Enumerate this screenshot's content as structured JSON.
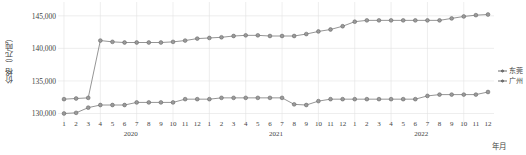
{
  "chart_data": {
    "type": "line",
    "title": "",
    "xlabel": "年月",
    "ylabel": "价格（元/吨）",
    "ylim": [
      129000,
      146200
    ],
    "yticks": [
      130000,
      135000,
      140000,
      145000
    ],
    "ytick_labels": [
      "130,000",
      "135,000",
      "140,000",
      "145,000"
    ],
    "grid": true,
    "legend_position": "right",
    "x": [
      "1",
      "2",
      "3",
      "4",
      "5",
      "6",
      "7",
      "8",
      "9",
      "10",
      "11",
      "12",
      "1",
      "2",
      "3",
      "4",
      "5",
      "6",
      "7",
      "8",
      "9",
      "10",
      "11",
      "12",
      "1",
      "2",
      "3",
      "4",
      "5",
      "6",
      "7",
      "8",
      "9",
      "10",
      "11",
      "12"
    ],
    "categories": [
      "2020-1",
      "2020-2",
      "2020-3",
      "2020-4",
      "2020-5",
      "2020-6",
      "2020-7",
      "2020-8",
      "2020-9",
      "2020-10",
      "2020-11",
      "2020-12",
      "2021-1",
      "2021-2",
      "2021-3",
      "2021-4",
      "2021-5",
      "2021-6",
      "2021-7",
      "2021-8",
      "2021-9",
      "2021-10",
      "2021-11",
      "2021-12",
      "2022-1",
      "2022-2",
      "2022-3",
      "2022-4",
      "2022-5",
      "2022-6",
      "2022-7",
      "2022-8",
      "2022-9",
      "2022-10",
      "2022-11",
      "2022-12"
    ],
    "year_groups": [
      {
        "label": "2020",
        "start_index": 0,
        "end_index": 11
      },
      {
        "label": "2021",
        "start_index": 12,
        "end_index": 23
      },
      {
        "label": "2022",
        "start_index": 24,
        "end_index": 35
      }
    ],
    "series": [
      {
        "name": "东莞",
        "color": "#7a7a7a",
        "values": [
          132200,
          132300,
          132400,
          141200,
          141000,
          140900,
          140900,
          140900,
          140900,
          141000,
          141200,
          141500,
          141600,
          141700,
          141900,
          142000,
          142000,
          141900,
          141900,
          141900,
          142200,
          142600,
          142900,
          143400,
          144100,
          144300,
          144300,
          144300,
          144300,
          144300,
          144300,
          144300,
          144600,
          144900,
          145100,
          145200
        ]
      },
      {
        "name": "广州",
        "color": "#7a7a7a",
        "values": [
          130000,
          130100,
          130900,
          131300,
          131300,
          131300,
          131700,
          131700,
          131700,
          131700,
          132200,
          132200,
          132200,
          132400,
          132400,
          132400,
          132400,
          132400,
          132400,
          131400,
          131300,
          131900,
          132200,
          132200,
          132200,
          132200,
          132200,
          132200,
          132200,
          132200,
          132700,
          132900,
          132900,
          132900,
          132900,
          133300
        ]
      }
    ]
  },
  "legend": {
    "items": [
      {
        "label": "东莞"
      },
      {
        "label": "广州"
      }
    ]
  }
}
